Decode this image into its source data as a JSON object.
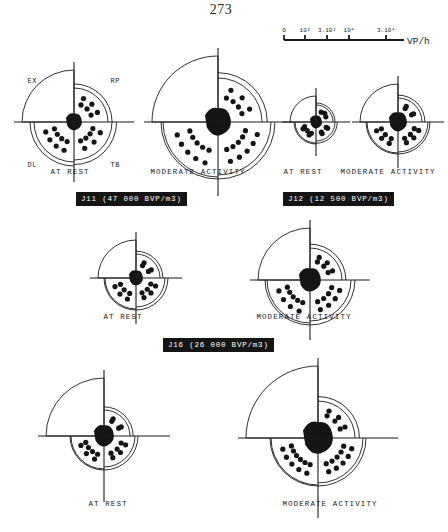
{
  "page": {
    "number": "273"
  },
  "scale": {
    "unit_label": "VP/h",
    "ticks": [
      {
        "label": "0",
        "value": 0,
        "pos": 0
      },
      {
        "label": "10³",
        "value": 1000,
        "pos": 0.175
      },
      {
        "label": "3.10³",
        "value": 3000,
        "pos": 0.33
      },
      {
        "label": "10⁴",
        "value": 10000,
        "pos": 0.5
      },
      {
        "label": "3.10⁴",
        "value": 30000,
        "pos": 0.8
      }
    ]
  },
  "quadrants": [
    {
      "code": "EX",
      "name": "EX",
      "position": "top-left"
    },
    {
      "code": "RP",
      "name": "RP",
      "position": "top-right"
    },
    {
      "code": "DL",
      "name": "DL",
      "position": "bottom-left"
    },
    {
      "code": "TB",
      "name": "TB",
      "position": "bottom-right"
    }
  ],
  "groups": [
    {
      "id": "J11",
      "bar_label": "J11 (47 000 BVP/m3)",
      "concentration": "47 000",
      "unit": "BVP/m3"
    },
    {
      "id": "J12",
      "bar_label": "J12 (12 500 BVP/m3)",
      "concentration": "12 500",
      "unit": "BVP/m3"
    },
    {
      "id": "J16",
      "bar_label": "J16 (26 000 BVP/m3)",
      "concentration": "26 000",
      "unit": "BVP/m3"
    }
  ],
  "captions": {
    "at_rest": "AT REST",
    "moderate_activity": "MODERATE ACTIVITY"
  },
  "chart_data": {
    "type": "pie",
    "xlabel": "",
    "ylabel": "VP/h",
    "legend_position": "top-right",
    "grid": false,
    "axis_unit": "VP/h",
    "radial_scale_ticks": [
      "0",
      "10³",
      "3.10³",
      "10⁴",
      "3.10⁴"
    ],
    "sector_names": [
      "EX",
      "RP",
      "DL",
      "TB"
    ],
    "panels": [
      {
        "group": "J11",
        "condition": "AT REST",
        "outer_radius": 52,
        "inner_radius": 44,
        "core_radius": 8,
        "sectors": [
          {
            "name": "EX",
            "radius": 52,
            "dots": 0
          },
          {
            "name": "RP",
            "radius": 34,
            "dots": 6
          },
          {
            "name": "DL",
            "radius": 40,
            "dots": 8
          },
          {
            "name": "TB",
            "radius": 38,
            "dots": 7
          }
        ]
      },
      {
        "group": "J11",
        "condition": "MODERATE ACTIVITY",
        "outer_radius": 66,
        "inner_radius": 57,
        "core_radius": 13,
        "sectors": [
          {
            "name": "EX",
            "radius": 66,
            "dots": 0
          },
          {
            "name": "RP",
            "radius": 44,
            "dots": 7
          },
          {
            "name": "DL",
            "radius": 55,
            "dots": 10
          },
          {
            "name": "TB",
            "radius": 53,
            "dots": 10
          }
        ]
      },
      {
        "group": "J12",
        "condition": "AT REST",
        "outer_radius": 26,
        "inner_radius": 22,
        "core_radius": 6,
        "sectors": [
          {
            "name": "EX",
            "radius": 26,
            "dots": 0
          },
          {
            "name": "RP",
            "radius": 17,
            "dots": 3
          },
          {
            "name": "DL",
            "radius": 21,
            "dots": 5
          },
          {
            "name": "TB",
            "radius": 19,
            "dots": 4
          }
        ]
      },
      {
        "group": "J12",
        "condition": "MODERATE ACTIVITY",
        "outer_radius": 38,
        "inner_radius": 32,
        "core_radius": 9,
        "sectors": [
          {
            "name": "EX",
            "radius": 38,
            "dots": 0
          },
          {
            "name": "RP",
            "radius": 24,
            "dots": 4
          },
          {
            "name": "DL",
            "radius": 31,
            "dots": 6
          },
          {
            "name": "TB",
            "radius": 30,
            "dots": 6
          }
        ]
      },
      {
        "group": "J16",
        "condition": "AT REST",
        "outer_radius": 38,
        "inner_radius": 32,
        "core_radius": 7,
        "sectors": [
          {
            "name": "EX",
            "radius": 38,
            "dots": 0
          },
          {
            "name": "RP",
            "radius": 24,
            "dots": 4
          },
          {
            "name": "DL",
            "radius": 31,
            "dots": 6
          },
          {
            "name": "TB",
            "radius": 29,
            "dots": 6
          }
        ]
      },
      {
        "group": "J16",
        "condition": "MODERATE ACTIVITY",
        "outer_radius": 52,
        "inner_radius": 45,
        "core_radius": 11,
        "sectors": [
          {
            "name": "EX",
            "radius": 52,
            "dots": 0
          },
          {
            "name": "RP",
            "radius": 32,
            "dots": 6
          },
          {
            "name": "DL",
            "radius": 43,
            "dots": 9
          },
          {
            "name": "TB",
            "radius": 41,
            "dots": 8
          }
        ]
      },
      {
        "group": "J16-lower",
        "condition": "AT REST",
        "outer_radius": 58,
        "inner_radius": 34,
        "core_radius": 10,
        "sectors": [
          {
            "name": "EX",
            "radius": 58,
            "dots": 0
          },
          {
            "name": "RP",
            "radius": 26,
            "dots": 4
          },
          {
            "name": "DL",
            "radius": 33,
            "dots": 7
          },
          {
            "name": "TB",
            "radius": 31,
            "dots": 6
          }
        ]
      },
      {
        "group": "J16-lower",
        "condition": "MODERATE ACTIVITY",
        "outer_radius": 72,
        "inner_radius": 48,
        "core_radius": 15,
        "sectors": [
          {
            "name": "EX",
            "radius": 72,
            "dots": 0
          },
          {
            "name": "RP",
            "radius": 37,
            "dots": 6
          },
          {
            "name": "DL",
            "radius": 47,
            "dots": 11
          },
          {
            "name": "TB",
            "radius": 45,
            "dots": 10
          }
        ]
      }
    ]
  }
}
